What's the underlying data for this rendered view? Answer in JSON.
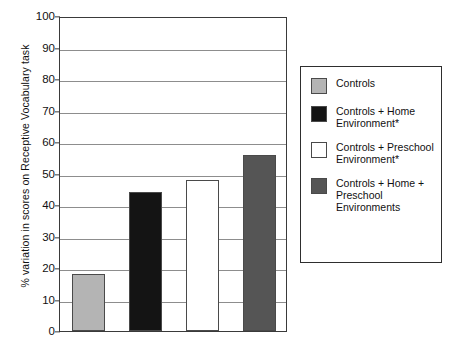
{
  "chart_data": {
    "type": "bar",
    "title": "",
    "xlabel": "",
    "ylabel": "% variation in scores on Receptive Vocabulary task",
    "ylim": [
      0,
      100
    ],
    "yticks": [
      0,
      10,
      20,
      30,
      40,
      50,
      60,
      70,
      80,
      90,
      100
    ],
    "grid": true,
    "legend_position": "right",
    "categories": [
      "Controls",
      "Controls + Home Environment*",
      "Controls + Preschool Environment*",
      "Controls + Home + Preschool Environments"
    ],
    "values": [
      18,
      44,
      48,
      56
    ],
    "colors": [
      "#b4b4b4",
      "#141414",
      "#ffffff",
      "#555555"
    ],
    "series": [
      {
        "name": "% variation in scores on Receptive Vocabulary task",
        "values": [
          18,
          44,
          48,
          56
        ]
      }
    ],
    "bars": [
      {
        "label": "Controls",
        "value": 18,
        "color": "#b4b4b4"
      },
      {
        "label": "Controls + Home Environment*",
        "value": 44,
        "color": "#141414"
      },
      {
        "label": "Controls + Preschool Environment*",
        "value": 48,
        "color": "#ffffff"
      },
      {
        "label": "Controls + Home + Preschool Environments",
        "value": 56,
        "color": "#555555"
      }
    ]
  },
  "legend": {
    "items": [
      {
        "label": "Controls",
        "color": "#b4b4b4"
      },
      {
        "label": "Controls + Home Environment*",
        "color": "#141414"
      },
      {
        "label": "Controls + Preschool Environment*",
        "color": "#ffffff"
      },
      {
        "label": "Controls + Home + Preschool Environments",
        "color": "#555555"
      }
    ]
  },
  "caption": {
    "partial_text": ""
  }
}
